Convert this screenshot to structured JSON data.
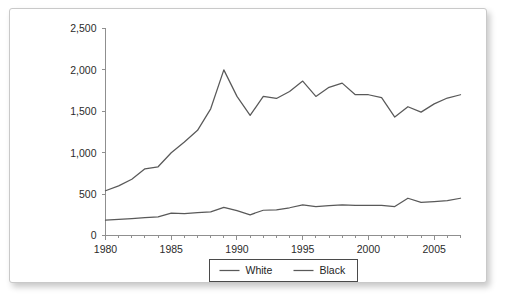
{
  "chart_data": {
    "type": "line",
    "title": "",
    "subtitle": "",
    "xlabel": "",
    "ylabel": "",
    "xlim": [
      1980,
      2007
    ],
    "ylim": [
      0,
      2500
    ],
    "grid": false,
    "legend_position": "bottom",
    "y_ticks": [
      0,
      500,
      1000,
      1500,
      2000,
      2500
    ],
    "y_tick_labels": [
      "0",
      "500",
      "1,000",
      "1,500",
      "2,000",
      "2,500"
    ],
    "x_ticks": [
      1980,
      1985,
      1990,
      1995,
      2000,
      2005
    ],
    "x_tick_labels": [
      "1980",
      "1985",
      "1990",
      "1995",
      "2000",
      "2005"
    ],
    "x_minor_ticks": [
      1981,
      1982,
      1983,
      1984,
      1986,
      1987,
      1988,
      1989,
      1991,
      1992,
      1993,
      1994,
      1996,
      1997,
      1998,
      1999,
      2001,
      2002,
      2003,
      2004,
      2006,
      2007
    ],
    "x": [
      1980,
      1981,
      1982,
      1983,
      1984,
      1985,
      1986,
      1987,
      1988,
      1989,
      1990,
      1991,
      1992,
      1993,
      1994,
      1995,
      1996,
      1997,
      1998,
      1999,
      2000,
      2001,
      2002,
      2003,
      2004,
      2005,
      2006,
      2007
    ],
    "series": [
      {
        "name": "White",
        "color": "#595959",
        "values": [
          540,
          600,
          680,
          805,
          830,
          1000,
          1130,
          1270,
          1530,
          2000,
          1680,
          1450,
          1680,
          1655,
          1740,
          1865,
          1680,
          1790,
          1840,
          1700,
          1700,
          1665,
          1430,
          1555,
          1490,
          1590,
          1660,
          1700
        ]
      },
      {
        "name": "Black",
        "color": "#595959",
        "values": [
          185,
          195,
          205,
          215,
          225,
          270,
          265,
          275,
          285,
          340,
          300,
          250,
          305,
          310,
          335,
          370,
          350,
          360,
          370,
          365,
          365,
          365,
          350,
          450,
          400,
          410,
          420,
          450
        ]
      }
    ]
  },
  "legend": {
    "items": [
      {
        "label": "White"
      },
      {
        "label": "Black"
      }
    ]
  }
}
